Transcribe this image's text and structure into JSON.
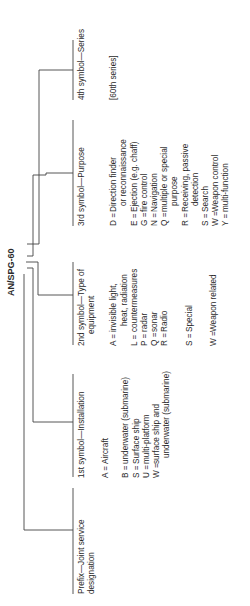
{
  "designation": "AN/SPG-60",
  "columns": [
    {
      "heading_line1": "Prefix—Joint service",
      "heading_line2": "designation",
      "entries": []
    },
    {
      "heading_line1": "1st symbol—Installation",
      "heading_line2": "",
      "entries": [
        {
          "code": "A =",
          "text": "Aircraft"
        },
        {
          "code": "",
          "text": ""
        },
        {
          "code": "B =",
          "text": "underwater (submarine)"
        },
        {
          "code": "S =",
          "text": "Surface ship"
        },
        {
          "code": "U =",
          "text": "multi-platform"
        },
        {
          "code": "W =",
          "text": "surface ship and"
        },
        {
          "code": "",
          "text": "underwater (submarine)"
        }
      ]
    },
    {
      "heading_line1": "2nd symbol—Type of",
      "heading_line2": "equipment",
      "entries": [
        {
          "code": "A =",
          "text": "invisible light,"
        },
        {
          "code": "",
          "text": "heat, radiation"
        },
        {
          "code": "L =",
          "text": "countermeasures"
        },
        {
          "code": "P =",
          "text": "radar"
        },
        {
          "code": "Q =",
          "text": "sonar"
        },
        {
          "code": "R =",
          "text": "Radio"
        },
        {
          "code": "",
          "text": ""
        },
        {
          "code": "S =",
          "text": "Special"
        },
        {
          "code": "",
          "text": ""
        },
        {
          "code": "W =",
          "text": "Weapon related"
        }
      ]
    },
    {
      "heading_line1": "3rd symbol—Purpose",
      "heading_line2": "",
      "entries": [
        {
          "code": "D =",
          "text": "Direction finder"
        },
        {
          "code": "",
          "text": "or reconnaissance"
        },
        {
          "code": "E =",
          "text": "Ejection (e.g. chaff)"
        },
        {
          "code": "G =",
          "text": "fire control"
        },
        {
          "code": "N =",
          "text": "Navigation"
        },
        {
          "code": "Q =",
          "text": "multiple or special"
        },
        {
          "code": "",
          "text": "purpose"
        },
        {
          "code": "R =",
          "text": "Receiving, passive"
        },
        {
          "code": "",
          "text": "detection"
        },
        {
          "code": "S =",
          "text": "Search"
        },
        {
          "code": "W =",
          "text": "Weapon control"
        },
        {
          "code": "Y =",
          "text": "multi-function"
        }
      ]
    },
    {
      "heading_line1": "4th symbol—Series",
      "heading_line2": "",
      "entries": [
        {
          "code": "",
          "text": "[60th series]"
        }
      ]
    }
  ]
}
